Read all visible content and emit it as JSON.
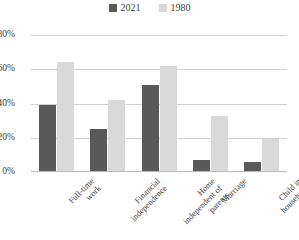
{
  "chart_data": {
    "type": "bar",
    "title": "",
    "subtitle": "",
    "xlabel": "",
    "ylabel": "",
    "categories": [
      "Full-time work",
      "Financial independence",
      "Home independent of parents",
      "Marriage",
      "Child in household"
    ],
    "category_lines": [
      [
        "Full-time",
        "work"
      ],
      [
        "Financial",
        "independence"
      ],
      [
        "Home",
        "independent of",
        "parents"
      ],
      [
        "Marriage"
      ],
      [
        "Child in",
        "household"
      ]
    ],
    "series": [
      {
        "name": "2021",
        "color": "#595959",
        "values": [
          39,
          25,
          51,
          7,
          6
        ]
      },
      {
        "name": "1980",
        "color": "#d9d9d9",
        "values": [
          64,
          42,
          62,
          33,
          19
        ]
      }
    ],
    "ylim": [
      0,
      80
    ],
    "yticks": [
      0,
      20,
      40,
      60,
      80
    ],
    "ytick_labels": [
      "0%",
      "20%",
      "40%",
      "60%",
      "80%"
    ],
    "grid": true,
    "legend_position": "top-center"
  },
  "legend": {
    "entries": [
      {
        "label": "2021"
      },
      {
        "label": "1980"
      }
    ]
  }
}
